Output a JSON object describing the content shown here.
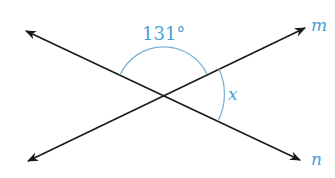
{
  "diagram": {
    "type": "intersecting-lines-angle",
    "lines": [
      {
        "name": "m",
        "label": "m"
      },
      {
        "name": "n",
        "label": "n"
      }
    ],
    "angles": [
      {
        "label": "131°",
        "position": "top"
      },
      {
        "label": "x",
        "position": "right"
      }
    ],
    "colors": {
      "line": "#1a1a1a",
      "accent": "#4a9fd8"
    }
  }
}
